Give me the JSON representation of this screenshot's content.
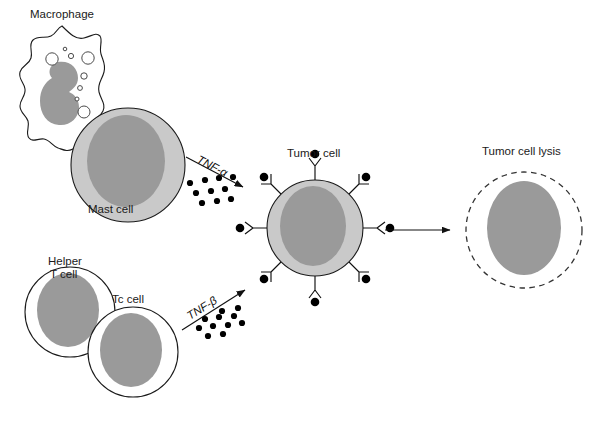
{
  "figure": {
    "width": 599,
    "height": 430,
    "background": "#ffffff"
  },
  "palette": {
    "cytoplasm_gray": "#c9c9c9",
    "nucleus_gray": "#9a9a9a",
    "outline_black": "#1a1a1a",
    "white_cell": "#ffffff",
    "dot_black": "#000000",
    "text_color": "#1a1a1a"
  },
  "labels": {
    "macrophage": "Macrophage",
    "mast_cell": "Mast cell",
    "helper_t_cell_line1": "Helper",
    "helper_t_cell_line2": "T cell",
    "tc_cell": "Tc cell",
    "tnf_alpha": "TNF-α",
    "tnf_beta": "TNF-β",
    "tumor_cell": "Tumor cell",
    "tumor_cell_lysis": "Tumor cell lysis"
  },
  "cells": {
    "macrophage": {
      "name": "Macrophage",
      "fill": "#ffffff",
      "nucleus_fill": "#9a9a9a",
      "shape": "amoeboid-irregular",
      "vacuole_count": 8,
      "nucleus_shape": "kidney"
    },
    "mast_cell": {
      "name": "Mast cell",
      "cx": 128,
      "cy": 165,
      "r": 57,
      "fill": "#c9c9c9",
      "nucleus_fill": "#9a9a9a",
      "nucleus_rx": 39,
      "nucleus_ry": 46
    },
    "helper_t_cell": {
      "name": "Helper T cell",
      "cx": 70,
      "cy": 312,
      "r": 45,
      "fill": "#ffffff",
      "nucleus_fill": "#9a9a9a",
      "nucleus_rx": 31,
      "nucleus_ry": 37
    },
    "tc_cell": {
      "name": "Tc cell",
      "cx": 133,
      "cy": 352,
      "r": 45,
      "fill": "#ffffff",
      "nucleus_fill": "#9a9a9a",
      "nucleus_rx": 31,
      "nucleus_ry": 37
    },
    "tumor_cell": {
      "name": "Tumor cell",
      "cx": 315,
      "cy": 228,
      "r": 48,
      "fill": "#c9c9c9",
      "nucleus_fill": "#9a9a9a",
      "nucleus_rx": 33,
      "nucleus_ry": 40,
      "receptor_count": 8,
      "receptor_description": "Y-shaped surface receptors each capped with a bound black TNF ligand dot"
    },
    "tumor_cell_lysis": {
      "name": "Tumor cell lysis",
      "cx": 524,
      "cy": 230,
      "r": 58,
      "fill": "#ffffff",
      "outline_style": "dashed",
      "nucleus_fill": "#9a9a9a",
      "nucleus_rx": 37,
      "nucleus_ry": 47
    }
  },
  "arrows": {
    "tnf_alpha": {
      "label": "TNF-α",
      "from": [
        186,
        157
      ],
      "to": [
        246,
        188
      ],
      "direction": "down-right",
      "ligand_dot_count": 10
    },
    "tnf_beta": {
      "label": "TNF-β",
      "from": [
        182,
        330
      ],
      "to": [
        248,
        288
      ],
      "direction": "up-right",
      "ligand_dot_count": 11
    },
    "lysis": {
      "label": "",
      "from": [
        385,
        230
      ],
      "to": [
        452,
        230
      ],
      "direction": "right"
    }
  },
  "tnf_alpha_dots": [
    [
      190,
      183
    ],
    [
      205,
      180
    ],
    [
      219,
      178
    ],
    [
      233,
      177
    ],
    [
      196,
      193
    ],
    [
      211,
      191
    ],
    [
      225,
      189
    ],
    [
      202,
      203
    ],
    [
      217,
      201
    ],
    [
      231,
      199
    ]
  ],
  "tnf_beta_dots": [
    [
      222,
      311
    ],
    [
      238,
      308
    ],
    [
      205,
      319
    ],
    [
      219,
      317
    ],
    [
      234,
      316
    ],
    [
      199,
      328
    ],
    [
      213,
      326
    ],
    [
      228,
      325
    ],
    [
      242,
      323
    ],
    [
      208,
      336
    ],
    [
      223,
      334
    ]
  ],
  "tumor_receptors": [
    {
      "angle_deg": 270,
      "name": "receptor-top"
    },
    {
      "angle_deg": 315,
      "name": "receptor-top-right"
    },
    {
      "angle_deg": 0,
      "name": "receptor-right"
    },
    {
      "angle_deg": 45,
      "name": "receptor-bottom-right"
    },
    {
      "angle_deg": 90,
      "name": "receptor-bottom"
    },
    {
      "angle_deg": 135,
      "name": "receptor-bottom-left"
    },
    {
      "angle_deg": 180,
      "name": "receptor-left"
    },
    {
      "angle_deg": 225,
      "name": "receptor-top-left"
    }
  ]
}
